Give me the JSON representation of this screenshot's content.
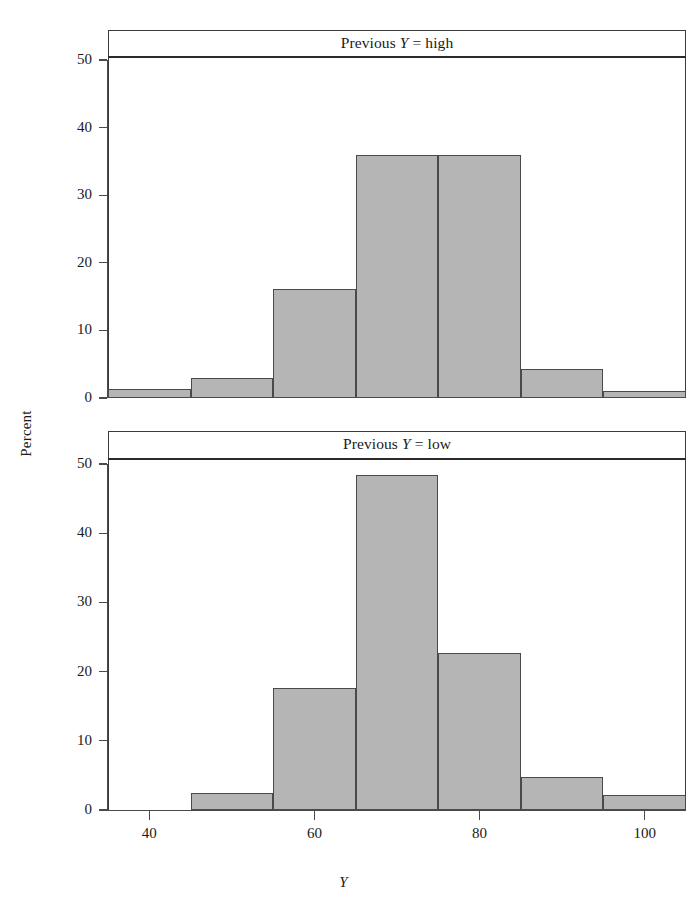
{
  "figure": {
    "ylabel": "Percent",
    "xlabel": "Y"
  },
  "panels": [
    {
      "strip_prefix": "Previous ",
      "strip_var": "Y",
      "strip_suffix": " = high",
      "strip_title": "Previous Y = high"
    },
    {
      "strip_prefix": "Previous ",
      "strip_var": "Y",
      "strip_suffix": " = low",
      "strip_title": "Previous Y = low"
    }
  ],
  "axis": {
    "y_ticks": [
      "0",
      "10",
      "20",
      "30",
      "40",
      "50"
    ],
    "x_ticks": [
      "40",
      "60",
      "80",
      "100"
    ]
  },
  "colors": {
    "bar_fill": "#b5b5b5",
    "bar_edge": "#4a4a4a",
    "frame": "#3b3b3b",
    "text": "#1a1a1a",
    "background": "#ffffff"
  },
  "chart_data": {
    "type": "bar",
    "title": "",
    "xlabel": "Y",
    "ylabel": "Percent",
    "xlim": [
      35,
      105
    ],
    "ylim": [
      0,
      51
    ],
    "grid": false,
    "legend": "none",
    "layout": "two stacked histogram panels sharing the x axis",
    "bin_width": 10,
    "bin_edges": [
      35,
      45,
      55,
      65,
      75,
      85,
      95,
      105
    ],
    "bin_centers": [
      40,
      50,
      60,
      70,
      80,
      90,
      100
    ],
    "panels": [
      {
        "name": "Previous Y = high",
        "categories": [
          "35-45",
          "45-55",
          "55-65",
          "65-75",
          "75-85",
          "85-95",
          "95-105"
        ],
        "values": [
          1.4,
          3.0,
          16.2,
          36.0,
          36.0,
          4.3,
          1.1
        ]
      },
      {
        "name": "Previous Y = low",
        "categories": [
          "35-45",
          "45-55",
          "55-65",
          "65-75",
          "75-85",
          "85-95",
          "95-105"
        ],
        "values": [
          0.0,
          2.4,
          17.7,
          48.4,
          22.7,
          4.8,
          2.2
        ]
      }
    ]
  }
}
